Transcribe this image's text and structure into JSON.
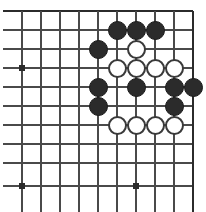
{
  "board": {
    "title": "Go board position",
    "description": "Top-right corner of a Go board showing a black and white contact fight",
    "geometry": {
      "width": 206,
      "height": 212,
      "spacing": 19,
      "origin_x": 22,
      "origin_y": 11,
      "cols": 10,
      "rows": 10,
      "stone_radius": 9.5
    },
    "colors": {
      "background": "#ffffff",
      "line": "#4a4a4a",
      "edge_line": "#2b2b2b",
      "black_stone": "#2b2b2b",
      "white_stone": "#ffffff",
      "white_stone_border": "#3a3a3a",
      "star_point": "#2b2b2b"
    },
    "edges": {
      "top": true,
      "right": true,
      "bottom": false,
      "left": false
    },
    "grid_lines_x": [
      22,
      41,
      60,
      79,
      98,
      117,
      136,
      155,
      174,
      193
    ],
    "grid_lines_y": [
      11,
      30,
      49,
      68,
      87,
      106,
      125,
      144,
      163,
      186
    ],
    "star_points": [
      {
        "x": 22,
        "y": 68
      },
      {
        "x": 22,
        "y": 186
      },
      {
        "x": 136,
        "y": 186
      }
    ],
    "stones": [
      {
        "color": "black",
        "x": 117,
        "y": 30,
        "label": "black-stone"
      },
      {
        "color": "black",
        "x": 136,
        "y": 30,
        "label": "black-stone"
      },
      {
        "color": "black",
        "x": 155,
        "y": 30,
        "label": "black-stone"
      },
      {
        "color": "black",
        "x": 98,
        "y": 49,
        "label": "black-stone"
      },
      {
        "color": "white",
        "x": 136,
        "y": 49,
        "label": "white-stone"
      },
      {
        "color": "white",
        "x": 117,
        "y": 68,
        "label": "white-stone"
      },
      {
        "color": "white",
        "x": 136,
        "y": 68,
        "label": "white-stone"
      },
      {
        "color": "white",
        "x": 155,
        "y": 68,
        "label": "white-stone"
      },
      {
        "color": "white",
        "x": 174,
        "y": 68,
        "label": "white-stone"
      },
      {
        "color": "black",
        "x": 98,
        "y": 87,
        "label": "black-stone"
      },
      {
        "color": "black",
        "x": 136,
        "y": 87,
        "label": "black-stone"
      },
      {
        "color": "black",
        "x": 174,
        "y": 87,
        "label": "black-stone"
      },
      {
        "color": "black",
        "x": 193,
        "y": 87,
        "label": "black-stone"
      },
      {
        "color": "black",
        "x": 98,
        "y": 106,
        "label": "black-stone"
      },
      {
        "color": "black",
        "x": 174,
        "y": 106,
        "label": "black-stone"
      },
      {
        "color": "white",
        "x": 117,
        "y": 125,
        "label": "white-stone"
      },
      {
        "color": "white",
        "x": 136,
        "y": 125,
        "label": "white-stone"
      },
      {
        "color": "white",
        "x": 155,
        "y": 125,
        "label": "white-stone"
      },
      {
        "color": "white",
        "x": 174,
        "y": 125,
        "label": "white-stone"
      }
    ],
    "counts": {
      "black_stones": 11,
      "white_stones": 8,
      "total_stones": 19
    }
  }
}
